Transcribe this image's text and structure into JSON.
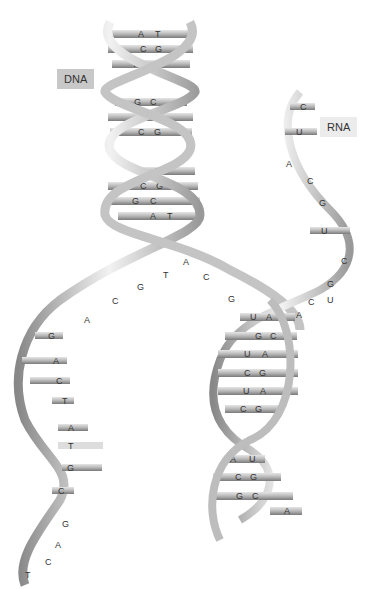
{
  "labels": {
    "dna": "DNA",
    "rna": "RNA"
  },
  "dna_double_helix": {
    "base_pairs": [
      {
        "left": "A",
        "right": "T"
      },
      {
        "left": "C",
        "right": "G"
      },
      {
        "left": "T",
        "right": "A"
      },
      {
        "left": "G",
        "right": "C"
      },
      {
        "left": "A",
        "right": "T"
      },
      {
        "left": "C",
        "right": "G"
      },
      {
        "left": "",
        "right": "A"
      },
      {
        "left": "C",
        "right": "G"
      },
      {
        "left": "G",
        "right": "C"
      },
      {
        "left": "A",
        "right": "T"
      }
    ]
  },
  "dna_unwound_strand_left": {
    "bases": [
      "A",
      "C",
      "G",
      "T",
      "A",
      "C",
      "G",
      "A",
      "C",
      "T",
      "A",
      "T",
      "G",
      "C",
      "G",
      "A",
      "C",
      "T"
    ]
  },
  "dna_unwound_strand_right": {
    "bases": [
      "A",
      "C",
      "G",
      "A",
      "C"
    ]
  },
  "rna_strand_top": {
    "bases": [
      "C",
      "U",
      "A",
      "C",
      "G",
      "U",
      "C",
      "G",
      "U"
    ]
  },
  "dna_rna_hybrid": {
    "base_pairs": [
      {
        "left": "U",
        "right": "A"
      },
      {
        "left": "G",
        "right": "C"
      },
      {
        "left": "U",
        "right": "A"
      },
      {
        "left": "C",
        "right": "G"
      },
      {
        "left": "U",
        "right": "A"
      },
      {
        "left": "C",
        "right": "G"
      },
      {
        "left": "A",
        "right": "U"
      },
      {
        "left": "C",
        "right": "G"
      },
      {
        "left": "G",
        "right": "C"
      },
      {
        "left": "",
        "right": "A"
      }
    ]
  }
}
